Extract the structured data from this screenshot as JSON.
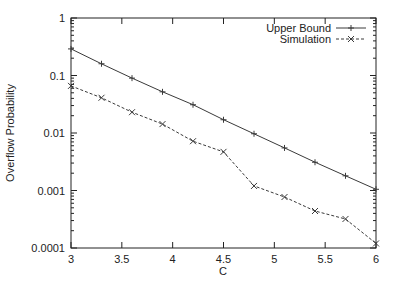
{
  "chart_data": {
    "type": "line",
    "title": "",
    "xlabel": "C",
    "ylabel": "Overflow Probability",
    "xlim": [
      3,
      6
    ],
    "ylim": [
      0.0001,
      1
    ],
    "yscale": "log",
    "grid": false,
    "legend_position": "top-right",
    "x_ticks": [
      "3",
      "3.5",
      "4",
      "4.5",
      "5",
      "5.5",
      "6"
    ],
    "y_ticks": [
      "0.0001",
      "0.001",
      "0.01",
      "0.1",
      "1"
    ],
    "x": [
      3.0,
      3.3,
      3.6,
      3.9,
      4.2,
      4.5,
      4.8,
      5.1,
      5.4,
      5.7,
      6.0
    ],
    "series": [
      {
        "name": "Upper Bound",
        "style": "solid",
        "marker": "+",
        "values": [
          0.29,
          0.16,
          0.09,
          0.052,
          0.031,
          0.017,
          0.0097,
          0.0055,
          0.0031,
          0.0018,
          0.00105
        ]
      },
      {
        "name": "Simulation",
        "style": "dashed",
        "marker": "x",
        "values": [
          0.066,
          0.041,
          0.023,
          0.0143,
          0.0072,
          0.0047,
          0.0012,
          0.00077,
          0.00044,
          0.00032,
          0.00012
        ]
      }
    ]
  },
  "colors": {
    "line": "#3a3a3a",
    "axis": "#222222"
  }
}
